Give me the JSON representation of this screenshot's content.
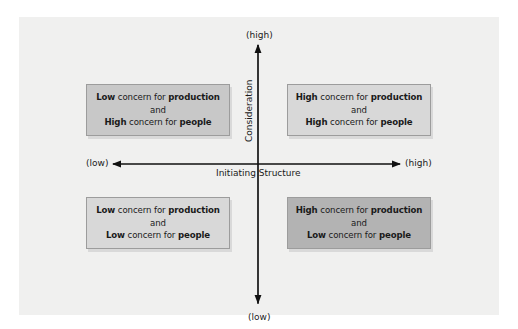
{
  "diagram": {
    "type": "2x2 leadership grid",
    "vertical_axis": {
      "title": "Consideration",
      "top_label": "(high)",
      "bottom_label": "(low)"
    },
    "horizontal_axis": {
      "title": "Initiating Structure",
      "left_label": "(low)",
      "right_label": "(high)"
    },
    "quadrants": {
      "top_left": {
        "line1_bold": "Low",
        "line1_mid": " concern for ",
        "line1_end": "production",
        "connector": "and",
        "line2_bold": "High",
        "line2_mid": " concern for ",
        "line2_end": "people",
        "fill": "#c8c8c8"
      },
      "top_right": {
        "line1_bold": "High",
        "line1_mid": " concern for ",
        "line1_end": "production",
        "connector": "and",
        "line2_bold": "High",
        "line2_mid": " concern for ",
        "line2_end": "people",
        "fill": "#d8d8d8"
      },
      "bottom_left": {
        "line1_bold": "Low",
        "line1_mid": " concern for ",
        "line1_end": "production",
        "connector": "and",
        "line2_bold": "Low",
        "line2_mid": " concern for ",
        "line2_end": "people",
        "fill": "#d8d8d8"
      },
      "bottom_right": {
        "line1_bold": "High",
        "line1_mid": " concern for ",
        "line1_end": "production",
        "connector": "and",
        "line2_bold": "Low",
        "line2_mid": " concern for ",
        "line2_end": "people",
        "fill": "#b3b3b3"
      }
    }
  }
}
